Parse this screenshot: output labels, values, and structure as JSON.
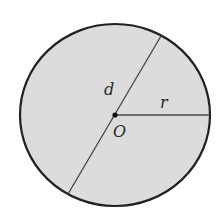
{
  "diagram": {
    "type": "circle-geometry",
    "colors": {
      "fill": "#dcdcdc",
      "stroke": "#222222",
      "line": "#444444",
      "background": "#ffffff"
    },
    "circle": {
      "cx": 115,
      "cy": 115,
      "rx": 95,
      "ry": 91
    },
    "center_point": {
      "x": 115,
      "y": 115,
      "label": "O"
    },
    "diameter": {
      "x1": 161,
      "y1": 36,
      "x2": 68,
      "y2": 194,
      "label": "d"
    },
    "radius": {
      "x1": 115,
      "y1": 115,
      "x2": 210,
      "y2": 115,
      "label": "r"
    }
  }
}
